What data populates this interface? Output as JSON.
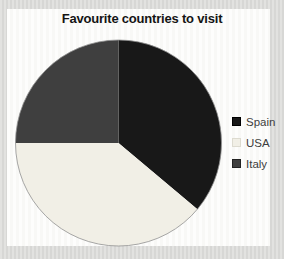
{
  "title": "Favourite countries to visit",
  "chart_data": {
    "type": "pie",
    "title": "Favourite countries to visit",
    "categories": [
      "Spain",
      "USA",
      "Italy"
    ],
    "values_percent": [
      36,
      39,
      25
    ],
    "angles_deg": [
      130,
      140,
      90
    ],
    "colors": [
      "#181818",
      "#f1efe6",
      "#3f3f3f"
    ],
    "start_angle_deg": 0,
    "direction": "clockwise",
    "legend_position": "right",
    "outline_color": "#909090"
  },
  "legend": {
    "items": [
      {
        "label": "Spain",
        "color": "#181818",
        "border": "#000000"
      },
      {
        "label": "USA",
        "color": "#f1efe6",
        "border": "#dddbd0"
      },
      {
        "label": "Italy",
        "color": "#3f3f3f",
        "border": "#222222"
      }
    ]
  },
  "colors": {
    "outer_background": "#dcdcda",
    "panel_background": "#fbfbf9",
    "title_text": "#141414",
    "legend_text": "#3d3d3d"
  }
}
